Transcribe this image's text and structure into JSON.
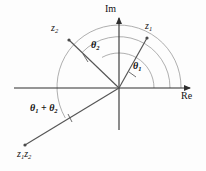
{
  "figure": {
    "background_color": "#fdfdfd",
    "line_color": "#3a3a3a",
    "text_color": "#111111",
    "width": 206,
    "height": 171
  },
  "axes": {
    "imaginary": {
      "label": "Im",
      "label_x": 106,
      "label_y": 9,
      "origin": [
        119,
        88
      ],
      "tip": [
        119,
        12
      ]
    },
    "real": {
      "label": "Re",
      "label_x": 183,
      "label_y": 93,
      "origin": [
        119,
        88
      ],
      "tip": [
        196,
        88
      ],
      "left_end": [
        14,
        88
      ]
    }
  },
  "vectors": [
    {
      "name": "z1",
      "label_main": "z",
      "label_sub": "1",
      "label_x": 146,
      "label_y": 23,
      "end": [
        147,
        38
      ],
      "angle_deg": 61
    },
    {
      "name": "z2",
      "label_main": "z",
      "label_sub": "2",
      "label_x": 52,
      "label_y": 25,
      "end": [
        69,
        40
      ],
      "angle_deg": 136
    },
    {
      "name": "z1z2",
      "label_main": "z",
      "label_sub": "1",
      "label_main2": "z",
      "label_sub2": "2",
      "label_x": 18,
      "label_y": 150,
      "end": [
        25,
        145
      ],
      "angle_deg": 210
    }
  ],
  "angles": [
    {
      "name": "theta1",
      "symbol": "θ",
      "subscript": "1",
      "label_x": 134,
      "label_y": 63,
      "radius": 35,
      "from_deg": 0,
      "to_deg": 61
    },
    {
      "name": "theta2",
      "symbol": "θ",
      "subscript": "2",
      "label_x": 92,
      "label_y": 42,
      "radius": 51,
      "from_deg": 61,
      "to_deg": 136
    },
    {
      "name": "theta1-plus-theta2",
      "symbol": "θ",
      "subscript": "1",
      "operator": "+",
      "symbol2": "θ",
      "subscript2": "2",
      "label_x": 31,
      "label_y": 105,
      "radius": 62,
      "from_deg": 0,
      "to_deg": 210
    }
  ],
  "arcs": [
    {
      "name": "inner-arc",
      "radius": 35
    },
    {
      "name": "middle-arc",
      "radius": 51
    },
    {
      "name": "outer-arc",
      "radius": 62
    }
  ]
}
